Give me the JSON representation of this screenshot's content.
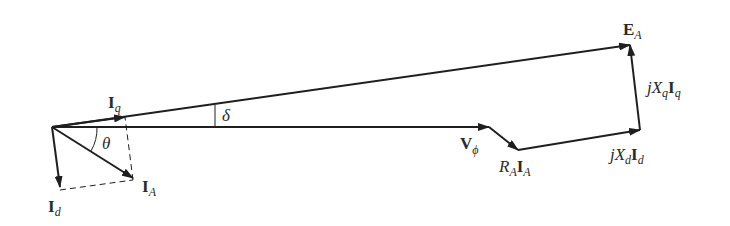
{
  "diagram": {
    "colors": {
      "line": "#1f1f1f",
      "text": "#2a2a2a",
      "background": "#ffffff"
    },
    "labels": {
      "Iq": {
        "main": "I",
        "sub": "q"
      },
      "Id": {
        "main": "I",
        "sub": "d"
      },
      "IA": {
        "main": "I",
        "sub": "A"
      },
      "theta": "θ",
      "delta": "δ",
      "Vphi": {
        "main": "V",
        "sub": "ϕ"
      },
      "RAIA": {
        "r": "R",
        "rsub": "A",
        "i": "I",
        "isub": "A"
      },
      "jXdId": {
        "j": "jX",
        "xsub": "d",
        "i": "I",
        "isub": "d"
      },
      "jXqIq": {
        "j": "jX",
        "xsub": "q",
        "i": "I",
        "isub": "q"
      },
      "EA": {
        "main": "E",
        "sub": "A"
      }
    },
    "vectors": [
      {
        "name": "V_phi",
        "from": [
          52,
          127
        ],
        "to": [
          489,
          127
        ]
      },
      {
        "name": "R_A I_A",
        "from": [
          489,
          127
        ],
        "to": [
          518,
          150
        ]
      },
      {
        "name": "jX_d I_d",
        "from": [
          518,
          150
        ],
        "to": [
          640,
          130
        ]
      },
      {
        "name": "jX_q I_q",
        "from": [
          640,
          130
        ],
        "to": [
          630,
          45
        ]
      },
      {
        "name": "E_A",
        "from": [
          52,
          127
        ],
        "to": [
          630,
          45
        ]
      },
      {
        "name": "I_A",
        "from": [
          52,
          127
        ],
        "to": [
          133,
          178
        ]
      },
      {
        "name": "I_d",
        "from": [
          52,
          127
        ],
        "to": [
          60,
          187
        ]
      },
      {
        "name": "I_q",
        "from": [
          52,
          127
        ],
        "to": [
          125,
          117
        ]
      }
    ]
  }
}
